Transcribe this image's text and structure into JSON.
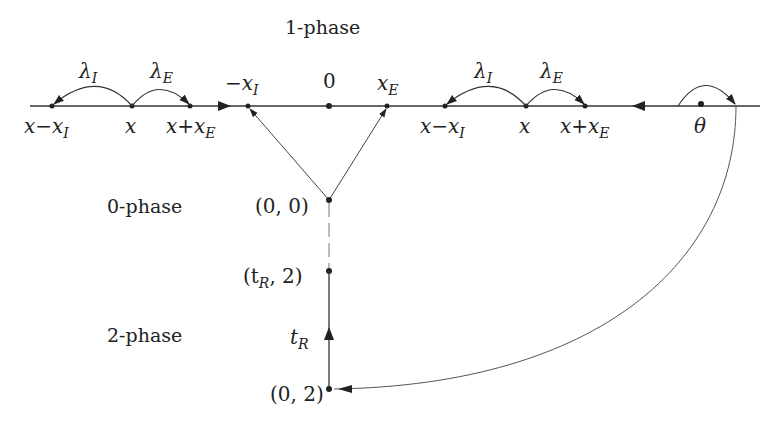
{
  "phases": {
    "one": "1-phase",
    "zero": "0-phase",
    "two": "2-phase"
  },
  "axis_labels": {
    "left_group": {
      "rate_I": "λ",
      "rate_I_sub": "I",
      "rate_E": "λ",
      "rate_E_sub": "E",
      "x_minus": "x−x",
      "x_minus_sub": "I",
      "x": "x",
      "x_plus": "x+x",
      "x_plus_sub": "E"
    },
    "center": {
      "neg_xI": "−x",
      "neg_xI_sub": "I",
      "zero": "0",
      "xE": "x",
      "xE_sub": "E"
    },
    "right_group": {
      "rate_I": "λ",
      "rate_I_sub": "I",
      "rate_E": "λ",
      "rate_E_sub": "E",
      "x_minus": "x−x",
      "x_minus_sub": "I",
      "x": "x",
      "x_plus": "x+x",
      "x_plus_sub": "E"
    },
    "theta": "θ"
  },
  "vertical_nodes": {
    "origin": "(0, 0)",
    "tR2_open": "(t",
    "tR2_sub": "R",
    "tR2_close": ", 2)",
    "tR": "t",
    "tR_sub": "R",
    "zero_two": "(0, 2)"
  },
  "colors": {
    "line": "#333333",
    "text": "#222222",
    "background": "#ffffff"
  }
}
